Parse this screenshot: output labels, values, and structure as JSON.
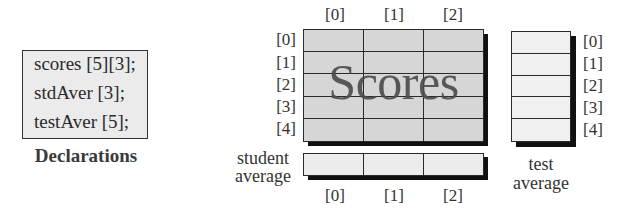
{
  "declarations": {
    "lines": [
      "scores [5][3];",
      "stdAver [3];",
      "testAver [5];"
    ],
    "title": "Declarations"
  },
  "scores_array": {
    "name": "Scores",
    "rows": 5,
    "cols": 3,
    "column_labels": [
      "[0]",
      "[1]",
      "[2]"
    ],
    "row_labels": [
      "[0]",
      "[1]",
      "[2]",
      "[3]",
      "[4]"
    ]
  },
  "student_average": {
    "caption_line1": "student",
    "caption_line2": "average",
    "column_labels": [
      "[0]",
      "[1]",
      "[2]"
    ]
  },
  "test_average": {
    "caption_line1": "test",
    "caption_line2": "average",
    "row_labels": [
      "[0]",
      "[1]",
      "[2]",
      "[3]",
      "[4]"
    ]
  },
  "colors": {
    "grid_fill": "#d6d6d6",
    "average_fill": "#ececec",
    "declaration_fill": "#ebebeb",
    "line": "#2a2a2a",
    "shadow": "#111111"
  }
}
